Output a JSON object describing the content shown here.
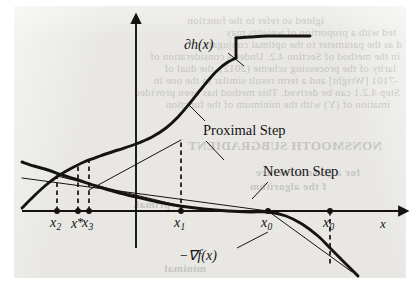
{
  "figure": {
    "kind": "scanned-textbook-figure",
    "caption_visible": false,
    "paper_color": "#e8e7e4",
    "ink_color": "#141312"
  },
  "labels": {
    "subgradient_curve": "∂h(x)",
    "gradient_curve": "−∇f(x)",
    "proximal_step": "Proximal Step",
    "newton_step": "Newton Step",
    "axis_x": "x"
  },
  "axis_ticks": [
    {
      "id": "x2",
      "base": "x",
      "sub": "2",
      "hat": false,
      "x": 57
    },
    {
      "id": "xstar",
      "base": "x",
      "sub": "*",
      "hat": false,
      "x": 78
    },
    {
      "id": "x3",
      "base": "x",
      "sub": "3",
      "hat": false,
      "x": 89
    },
    {
      "id": "x1",
      "base": "x",
      "sub": "1",
      "hat": false,
      "x": 181
    },
    {
      "id": "x0hat",
      "base": "x",
      "sub": "0",
      "hat": true,
      "x": 268
    },
    {
      "id": "x0",
      "base": "x",
      "sub": "0",
      "hat": false,
      "x": 330
    }
  ],
  "chart_data": {
    "type": "line",
    "title": "",
    "xlabel": "x",
    "ylabel": "",
    "grid": false,
    "legend": "inline-annotations",
    "axis": {
      "x_axis_y_px": 211,
      "y_axis_x_px": 136,
      "x_axis_start_px": 22,
      "x_axis_end_px": 400,
      "y_axis_top_px": 22,
      "y_axis_bottom_px": 248
    },
    "series": [
      {
        "name": "∂h(x)",
        "style": "thick-solid",
        "note": "monotone increasing subdifferential with a jump discontinuity",
        "points_px": [
          [
            22,
            208
          ],
          [
            34,
            196
          ],
          [
            46,
            185
          ],
          [
            58,
            176
          ],
          [
            70,
            169
          ],
          [
            84,
            162
          ],
          [
            100,
            156
          ],
          [
            118,
            150
          ],
          [
            136,
            144
          ],
          [
            152,
            137
          ],
          [
            166,
            128
          ],
          [
            178,
            117
          ],
          [
            190,
            103
          ],
          [
            202,
            88
          ],
          [
            212,
            76
          ],
          [
            220,
            68
          ],
          [
            228,
            62
          ],
          [
            236,
            58
          ]
        ],
        "jump_px": {
          "x": 236,
          "y_low": 58,
          "y_high": 38
        },
        "points_after_jump_px": [
          [
            236,
            38
          ],
          [
            250,
            37
          ],
          [
            266,
            36
          ],
          [
            282,
            36
          ],
          [
            296,
            36
          ],
          [
            310,
            36
          ]
        ]
      },
      {
        "name": "−∇f(x)",
        "style": "thick-solid",
        "note": "decreasing concave curve crossing axis near x-hat-0",
        "points_px": [
          [
            22,
            162
          ],
          [
            34,
            166
          ],
          [
            48,
            170
          ],
          [
            62,
            175
          ],
          [
            78,
            180
          ],
          [
            96,
            186
          ],
          [
            116,
            192
          ],
          [
            136,
            197
          ],
          [
            158,
            202
          ],
          [
            180,
            206
          ],
          [
            204,
            209
          ],
          [
            228,
            211
          ],
          [
            250,
            212
          ],
          [
            268,
            212
          ],
          [
            286,
            216
          ],
          [
            302,
            224
          ],
          [
            318,
            236
          ],
          [
            330,
            248
          ],
          [
            340,
            258
          ],
          [
            350,
            268
          ],
          [
            358,
            276
          ]
        ]
      },
      {
        "name": "newton-step-line",
        "style": "thin-solid",
        "points_px": [
          [
            22,
            178
          ],
          [
            268,
            211
          ],
          [
            352,
            272
          ]
        ]
      },
      {
        "name": "proximal-secant-1",
        "style": "thin-solid",
        "points_px": [
          [
            181,
            206
          ],
          [
            57,
            176
          ]
        ]
      },
      {
        "name": "proximal-secant-2",
        "style": "thin-solid",
        "points_px": [
          [
            181,
            140
          ],
          [
            89,
            190
          ]
        ]
      }
    ],
    "dashed_drops_px": [
      {
        "x": 57,
        "y_from": 211,
        "y_to": 176
      },
      {
        "x": 78,
        "y_from": 211,
        "y_to": 166
      },
      {
        "x": 89,
        "y_from": 211,
        "y_to": 160
      },
      {
        "x": 181,
        "y_from": 211,
        "y_to": 140
      },
      {
        "x": 330,
        "y_from": 211,
        "y_to": 266
      }
    ],
    "axis_dots_px": [
      57,
      78,
      89,
      181,
      268,
      330
    ]
  },
  "annotations": [
    {
      "id": "subgradient-label",
      "text": "∂h(x)",
      "x": 184,
      "y": 37,
      "leader_px": [
        [
          228,
          53
        ],
        [
          244,
          66
        ]
      ]
    },
    {
      "id": "proximal-step-label",
      "text": "Proximal Step",
      "x": 203,
      "y": 122,
      "leader_top_px": [
        [
          205,
          121
        ],
        [
          188,
          104
        ]
      ],
      "leader_bottom_px": [
        [
          206,
          141
        ],
        [
          224,
          160
        ]
      ]
    },
    {
      "id": "newton-step-label",
      "text": "Newton Step",
      "x": 263,
      "y": 163,
      "leader_px": [
        [
          268,
          182
        ],
        [
          252,
          199
        ]
      ]
    },
    {
      "id": "gradient-label",
      "text": "−∇f(x)",
      "x": 179,
      "y": 247,
      "leader_px": [
        [
          237,
          248
        ],
        [
          268,
          232
        ]
      ]
    }
  ],
  "bleed_text": {
    "note": "faint mirrored show-through from the reverse side of the scanned page",
    "lines": [
      {
        "text": "ighted so refer to the function",
        "x": 96,
        "y": 14,
        "size": 11
      },
      {
        "text": "ted with a proportion of weights may",
        "x": 24,
        "y": 26,
        "size": 11
      },
      {
        "text": "d as the parameter to the optimal conjugate",
        "x": 18,
        "y": 38,
        "size": 11
      },
      {
        "text": "in the method of Section 4.2. Under a consideration of",
        "x": 20,
        "y": 50,
        "size": 11
      },
      {
        "text": "larity of the processing scheme (2012), the dual of",
        "x": 24,
        "y": 62,
        "size": 11
      },
      {
        "text": "-7101 [Wright] and a term result similar to the one in",
        "x": 22,
        "y": 74,
        "size": 11
      },
      {
        "text": "Step 4.2.1 can be derived. This method has been provided",
        "x": 20,
        "y": 86,
        "size": 11
      },
      {
        "text": "imation of (Y) with the minimum of the function",
        "x": 30,
        "y": 98,
        "size": 11
      }
    ],
    "headings": [
      {
        "text": "NONSMOOTH SUBGRADIENT",
        "x": 38,
        "y": 138,
        "size": 13
      },
      {
        "text": "for a given structure",
        "x": 60,
        "y": 166,
        "size": 11
      },
      {
        "text": "f the algorithm",
        "x": 94,
        "y": 180,
        "size": 11
      },
      {
        "text": "primal.",
        "x": 250,
        "y": 198,
        "size": 11
      },
      {
        "text": "minimal",
        "x": 214,
        "y": 262,
        "size": 11
      }
    ]
  }
}
